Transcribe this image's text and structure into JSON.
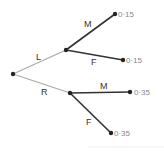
{
  "diagram": {
    "type": "probability-tree",
    "first_branches": [
      {
        "label": "L",
        "color": "#aaaaaa"
      },
      {
        "label": "R",
        "color": "#aaaaaa"
      }
    ],
    "second_branches": {
      "L": [
        {
          "label": "M",
          "value": "0·15"
        },
        {
          "label": "F",
          "value": "0·15"
        }
      ],
      "R": [
        {
          "label": "M",
          "value": "0·35"
        },
        {
          "label": "F",
          "value": "0·35"
        }
      ]
    }
  }
}
